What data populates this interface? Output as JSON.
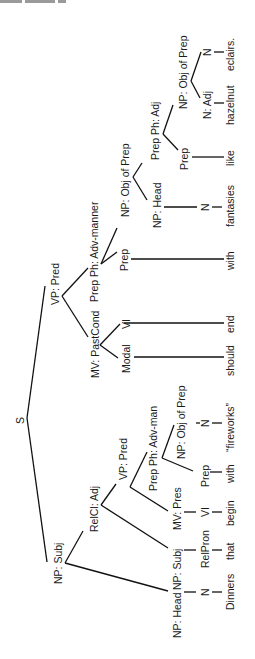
{
  "header": {
    "text_visible": false,
    "note": "cropped header fragment"
  },
  "diagram": {
    "type": "syntax-tree",
    "orientation": "rotated-90-ccw",
    "root": "S",
    "nodes": {
      "s": "S",
      "np_subj": "NP: Subj",
      "np_head_1": "NP: Head",
      "n_1": "N",
      "relcl_adj": "RelCl: Adj",
      "np_subj_2": "NP: Subj",
      "relpron": "RelPron",
      "vp_pred_2": "VP: Pred",
      "mv_pres": "MV: Pres",
      "vi_1": "VI",
      "prep_ph_adv_man": "Prep Ph: Adv-man",
      "prep_1": "Prep",
      "np_obj_prep_1": "NP: Obj of Prep",
      "n_2": "N",
      "vp_pred": "VP: Pred",
      "mv_pastcond": "MV: PastCond",
      "modal": "Modal",
      "vi_2": "VI",
      "prep_ph_adv_manner": "Prep Ph: Adv-manner",
      "prep_2": "Prep",
      "np_obj_prep_2": "NP: Obj of Prep",
      "np_head_2": "NP: Head",
      "n_3": "N",
      "prep_ph_adj": "Prep Ph: Adj",
      "prep_3": "Prep",
      "np_obj_prep_3": "NP: Obj of Prep",
      "n_adj": "N: Adj",
      "n_4": "N"
    },
    "words": [
      "Dinners",
      "that",
      "begin",
      "with",
      "“fireworks”",
      "should",
      "end",
      "with",
      "fantasies",
      "like",
      "hazelnut",
      "eclairs."
    ]
  }
}
